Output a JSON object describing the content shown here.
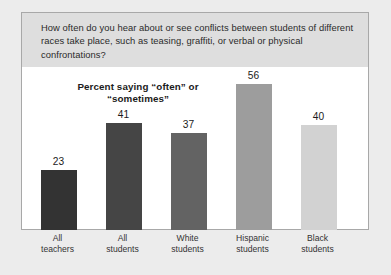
{
  "question": "How often do you hear about or see conflicts between students of different races take place, such as teasing, graffiti, or verbal or physical confrontations?",
  "title_line1": "Percent saying “often”",
  "title_line2": "or “sometimes”",
  "colors": {
    "page_background": "#ececec",
    "header_band": "#dedede",
    "panel_background": "#ffffff",
    "panel_border": "#a8a8a8",
    "text": "#2b2b2b"
  },
  "chart_data": {
    "type": "bar",
    "title": "Percent saying “often” or “sometimes”",
    "categories": [
      "All teachers",
      "All students",
      "White students",
      "Hispanic students",
      "Black students"
    ],
    "category_lines": [
      [
        "All",
        "teachers"
      ],
      [
        "All",
        "students"
      ],
      [
        "White",
        "students"
      ],
      [
        "Hispanic",
        "students"
      ],
      [
        "Black",
        "students"
      ]
    ],
    "values": [
      23,
      41,
      37,
      56,
      40
    ],
    "value_labels": [
      "23",
      "41",
      "37",
      "56",
      "40"
    ],
    "bar_colors": [
      "#333333",
      "#454545",
      "#636363",
      "#9d9d9d",
      "#d2d2d2"
    ],
    "xlabel": "",
    "ylabel": "",
    "ylim": [
      0,
      62
    ],
    "grid": false,
    "legend": false
  }
}
